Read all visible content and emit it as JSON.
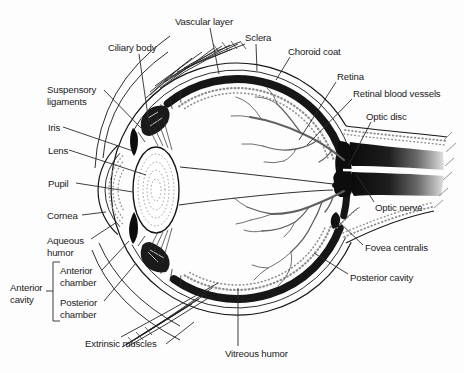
{
  "figure": {
    "kind": "anatomical line diagram"
  },
  "colors": {
    "background": "#fdfdfd",
    "line_art": "#161616",
    "label_text": "#1b1b1b",
    "vessel_gray": "#606060",
    "stipple_gray": "#8f8f8f"
  },
  "labels": {
    "vascular_layer": "Vascular layer",
    "ciliary_body": "Ciliary body",
    "sclera": "Sclera",
    "choroid_coat": "Choroid coat",
    "retina": "Retina",
    "retinal_blood_vessels": "Retinal blood vessels",
    "optic_disc": "Optic disc",
    "optic_nerve": "Optic nerve",
    "fovea_centralis": "Fovea centralis",
    "posterior_cavity": "Posterior cavity",
    "suspensory_ligaments": {
      "line1": "Suspensory",
      "line2": "ligaments"
    },
    "iris": "Iris",
    "lens": "Lens",
    "pupil": "Pupil",
    "cornea": "Cornea",
    "aqueous_humor": {
      "line1": "Aqueous",
      "line2": "humor"
    },
    "anterior_chamber": {
      "line1": "Anterior",
      "line2": "chamber"
    },
    "posterior_chamber": {
      "line1": "Posterior",
      "line2": "chamber"
    },
    "anterior_cavity": {
      "line1": "Anterior",
      "line2": "cavity"
    },
    "extrinsic_muscles": "Extrinsic muscles",
    "vitreous_humor": "Vitreous humor"
  }
}
